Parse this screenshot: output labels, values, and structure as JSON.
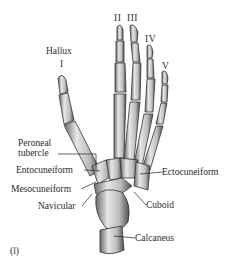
{
  "figure": {
    "panel_label": "(l)",
    "digit_labels": [
      {
        "id": "I",
        "text": "I"
      },
      {
        "id": "II",
        "text": "II"
      },
      {
        "id": "III",
        "text": "III"
      },
      {
        "id": "IV",
        "text": "IV"
      },
      {
        "id": "V",
        "text": "V"
      }
    ],
    "hallux_label": "Hallux",
    "bone_labels": {
      "peroneal_tubercle_line1": "Peroneal",
      "peroneal_tubercle_line2": "tubercle",
      "entocuneiform": "Entocuneiform",
      "mesocuneiform": "Mesocuneiform",
      "navicular": "Navicular",
      "ectocuneiform": "Ectocuneiform",
      "cuboid": "Cuboid",
      "calcaneus": "Calcaneus"
    },
    "colors": {
      "bone_fill": "#cfcfcf",
      "bone_shadow": "#5a5a5a",
      "line": "#222222",
      "background": "#ffffff"
    }
  }
}
